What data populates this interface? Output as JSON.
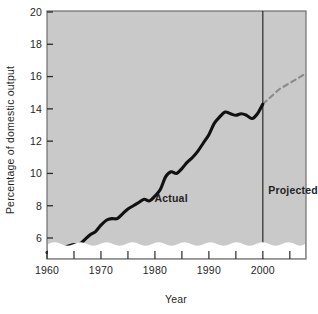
{
  "chart_data": {
    "type": "line",
    "title": "",
    "xlabel": "Year",
    "ylabel": "Percentage of domestic output",
    "xlim": [
      1960,
      2008
    ],
    "ylim": [
      5,
      20
    ],
    "y_axis_break": true,
    "grid": false,
    "legend_position": "inline-annotations",
    "x_major_ticks": [
      1960,
      1970,
      1980,
      1990,
      2000
    ],
    "x_minor_ticks": [
      1965,
      1975,
      1985,
      1995,
      2005
    ],
    "x_tick_labels": [
      "1960",
      "1970",
      "1980",
      "1990",
      "2000"
    ],
    "y_ticks": [
      6,
      8,
      10,
      12,
      14,
      16,
      18,
      20
    ],
    "y_tick_labels": [
      "6",
      "8",
      "10",
      "12",
      "14",
      "16",
      "18",
      "20"
    ],
    "annotations": [
      {
        "text": "Actual",
        "x": 1983,
        "y": 8.2
      },
      {
        "text": "Projected",
        "x": 2001,
        "y": 8.7
      }
    ],
    "divider_year": 2000,
    "series": [
      {
        "name": "Actual",
        "style": "solid",
        "color": "#111111",
        "x": [
          1960,
          1961,
          1962,
          1963,
          1964,
          1965,
          1966,
          1967,
          1968,
          1969,
          1970,
          1971,
          1972,
          1973,
          1974,
          1975,
          1976,
          1977,
          1978,
          1979,
          1980,
          1981,
          1982,
          1983,
          1984,
          1985,
          1986,
          1987,
          1988,
          1989,
          1990,
          1991,
          1992,
          1993,
          1994,
          1995,
          1996,
          1997,
          1998,
          1999,
          2000
        ],
        "values": [
          5.1,
          5.2,
          5.3,
          5.4,
          5.5,
          5.6,
          5.6,
          5.9,
          6.2,
          6.4,
          6.8,
          7.1,
          7.2,
          7.2,
          7.5,
          7.8,
          8.0,
          8.2,
          8.4,
          8.3,
          8.6,
          9.0,
          9.8,
          10.1,
          10.0,
          10.3,
          10.7,
          11.0,
          11.4,
          11.9,
          12.4,
          13.1,
          13.5,
          13.8,
          13.7,
          13.6,
          13.7,
          13.6,
          13.4,
          13.7,
          14.3
        ]
      },
      {
        "name": "Projected",
        "style": "dashed",
        "color": "#8a8a8a",
        "x": [
          2000,
          2001,
          2002,
          2003,
          2004,
          2005,
          2006,
          2007,
          2008
        ],
        "values": [
          14.3,
          14.6,
          14.9,
          15.2,
          15.4,
          15.6,
          15.8,
          16.0,
          16.2
        ]
      }
    ]
  },
  "style": {
    "plot_background": "#c9c9c9",
    "plot_border": "#6e6e6e",
    "page_background": "#ffffff",
    "break_band": "#ffffff",
    "actual_color": "#111111",
    "projected_color": "#8a8a8a",
    "text_color": "#1f1f1f"
  }
}
